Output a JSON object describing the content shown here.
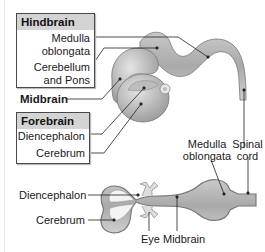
{
  "hindbrain_box": {
    "title": "Hindbrain",
    "items": [
      "Medulla",
      "oblongata",
      "Cerebellum",
      "and Pons"
    ]
  },
  "midbrain_label": "Midbrain",
  "forebrain_box": {
    "title": "Forebrain",
    "items": [
      "Diencephalon",
      "Cerebrum"
    ]
  },
  "lower_diagram": {
    "labels": {
      "medulla_line1": "Medulla",
      "medulla_line2": "oblongata",
      "spinal_line1": "Spinal",
      "spinal_line2": "cord",
      "diencephalon": "Diencephalon",
      "cerebrum": "Cerebrum",
      "eye": "Eye",
      "midbrain": "Midbrain"
    }
  },
  "colors": {
    "tissue": "#b8b8b8",
    "box_header": "#d4d4d4",
    "line": "#222222"
  }
}
